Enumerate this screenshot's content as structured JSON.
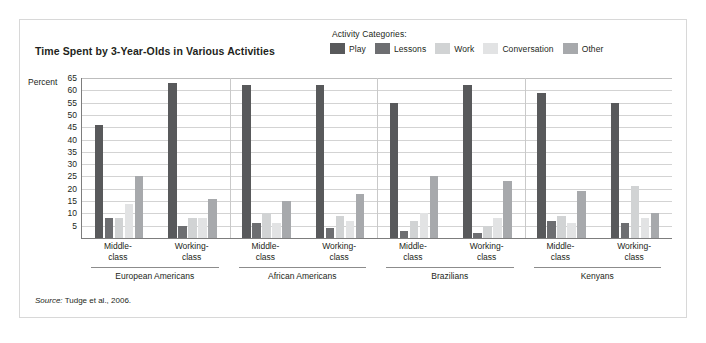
{
  "figure": {
    "title": "Time Spent by 3-Year-Olds in Various Activities",
    "axis_label": "Percent",
    "source_prefix": "Source:",
    "source_text": "Tudge et al., 2006.",
    "border_color": "#d8d8d8",
    "background": "#ffffff"
  },
  "legend": {
    "title": "Activity Categories:",
    "items": [
      {
        "label": "Play",
        "color": "#58595b"
      },
      {
        "label": "Lessons",
        "color": "#6d6e71"
      },
      {
        "label": "Work",
        "color": "#d1d3d4"
      },
      {
        "label": "Conversation",
        "color": "#e2e3e4"
      },
      {
        "label": "Other",
        "color": "#a7a9ac"
      }
    ]
  },
  "chart_data": {
    "type": "bar",
    "title": "Time Spent by 3-Year-Olds in Various Activities",
    "xlabel": "",
    "ylabel": "Percent",
    "ylim": [
      0,
      65
    ],
    "ytick_values": [
      5,
      10,
      15,
      20,
      25,
      30,
      35,
      40,
      45,
      50,
      55,
      60,
      65
    ],
    "grid": true,
    "legend_position": "top-right",
    "categories": [
      "European Americans / Middle-class",
      "European Americans / Working-class",
      "African Americans / Middle-class",
      "African Americans / Working-class",
      "Brazilians / Middle-class",
      "Brazilians / Working-class",
      "Kenyans / Middle-class",
      "Kenyans / Working-class"
    ],
    "groups": [
      {
        "culture": "European Americans",
        "classes": [
          {
            "label_line1": "Middle-",
            "label_line2": "class",
            "values": [
              46,
              8,
              8,
              14,
              25
            ]
          },
          {
            "label_line1": "Working-",
            "label_line2": "class",
            "values": [
              63,
              5,
              8,
              8,
              16
            ]
          }
        ]
      },
      {
        "culture": "African Americans",
        "classes": [
          {
            "label_line1": "Middle-",
            "label_line2": "class",
            "values": [
              62,
              6,
              10,
              6,
              15
            ]
          },
          {
            "label_line1": "Working-",
            "label_line2": "class",
            "values": [
              62,
              4,
              9,
              7,
              18
            ]
          }
        ]
      },
      {
        "culture": "Brazilians",
        "classes": [
          {
            "label_line1": "Middle-",
            "label_line2": "class",
            "values": [
              55,
              3,
              7,
              10,
              25
            ]
          },
          {
            "label_line1": "Working-",
            "label_line2": "class",
            "values": [
              62,
              2,
              5,
              8,
              23
            ]
          }
        ]
      },
      {
        "culture": "Kenyans",
        "classes": [
          {
            "label_line1": "Middle-",
            "label_line2": "class",
            "values": [
              59,
              7,
              9,
              6,
              19
            ]
          },
          {
            "label_line1": "Working-",
            "label_line2": "class",
            "values": [
              55,
              6,
              21,
              8,
              10
            ]
          }
        ]
      }
    ],
    "series": [
      {
        "name": "Play",
        "values": [
          46,
          63,
          62,
          62,
          55,
          62,
          59,
          55
        ]
      },
      {
        "name": "Lessons",
        "values": [
          8,
          5,
          6,
          4,
          3,
          2,
          7,
          6
        ]
      },
      {
        "name": "Work",
        "values": [
          8,
          8,
          10,
          9,
          7,
          5,
          9,
          21
        ]
      },
      {
        "name": "Conversation",
        "values": [
          14,
          8,
          6,
          7,
          10,
          8,
          6,
          8
        ]
      },
      {
        "name": "Other",
        "values": [
          25,
          16,
          15,
          18,
          25,
          23,
          19,
          10
        ]
      }
    ]
  }
}
